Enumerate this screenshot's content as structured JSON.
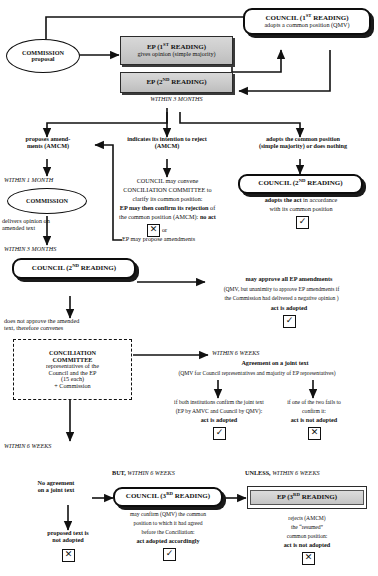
{
  "diagram": {
    "nodes": {
      "commission_proposal": {
        "line1": "COMMISSION",
        "line2": "proposal"
      },
      "ep_first_reading": {
        "line1": "EP (1ST READING)",
        "line2": "gives opinion (simple majority)"
      },
      "council_first_reading": {
        "line1": "COUNCIL  (1ST READING)",
        "line2": "adopts a common position (QMV)"
      },
      "ep_second_reading": {
        "line1": "EP (2ND READING)"
      },
      "commission_opinion": {
        "line1": "COMMISSION"
      },
      "council_second_reading_right": {
        "line1": "COUNCIL (2ND READING)"
      },
      "council_second_reading_left": {
        "line1": "COUNCIL (2ND READING)"
      },
      "conciliation_committee": {
        "line1": "CONCILIATION",
        "line2": "COMMITTEE",
        "line3": "representatives of the",
        "line4": "Council and the EP",
        "line5": "(15 each)",
        "line6": "+ Commission"
      },
      "council_third_reading": {
        "line1": "COUNCIL (3RD READING)"
      },
      "ep_third_reading": {
        "line1": "EP  (3RD READING)"
      }
    },
    "labels": {
      "within_3_months_top": "WITHIN 3 MONTHS",
      "branch_amend": "proposes amend-\nments (AMCM)",
      "branch_reject": "indicates its intention to reject\n(AMCM)",
      "branch_adopt": "adopts the common position\n(simple majority) or does nothing",
      "within_1_month": "WITHIN 1 MONTH",
      "commission_delivers": "delivers opinion on\namended text",
      "within_3_months_second": "WITHIN 3 MONTHS",
      "council_convene_1": "COUNCIL may convene",
      "council_convene_2": "CONCILIATION COMMITTEE to",
      "council_convene_3": "clarify its common position:",
      "council_convene_4_bold": "EP may then confirm its rejection",
      "council_convene_4_tail": " of",
      "council_convene_5_lead": "the common position (AMCM): ",
      "council_convene_5_bold": "no act",
      "or_label": "or",
      "ep_propose_amendments": "EP may propose amendments",
      "council_2nd_adopts_1_bold": "adopts the act",
      "council_2nd_adopts_1_tail": " in accordance",
      "council_2nd_adopts_2": "with its common position",
      "may_approve_bold": "may approve all EP amendments",
      "may_approve_2": "(QMV, but unanimity to approve EP amendments if",
      "may_approve_3": "the Commission had delivered a negative opinion )",
      "act_is_adopted": "act is adopted",
      "does_not_approve": "does not approve the amended\ntext, therefore convenes",
      "within_6_weeks_cc": "WITHIN 6 WEEKS",
      "agreement_joint_text": "Agreement on a joint text",
      "agreement_qmv": "(QMV for Council representatives and majority of EP representatives)",
      "both_confirm_1": "if both institutions confirm the joint text",
      "both_confirm_2": "(EP by AMVC and Council by QMV):",
      "both_confirm_3": "act is adopted",
      "one_fails_1": "if one of the two fails to",
      "one_fails_2": "confirm it:",
      "one_fails_3": "act is not adopted",
      "within_6_weeks_left": "WITHIN 6 WEEKS",
      "no_agreement": "No agreement\non a joint text",
      "proposed_text_not_adopted": "proposed text is\nnot adopted",
      "but_within_6_weeks_bold": "BUT,",
      "but_within_6_weeks_it": " WITHIN 6 WEEKS",
      "unless_within_6_weeks_bold": "UNLESS,",
      "unless_within_6_weeks_it": " WITHIN 6 WEEKS",
      "council_3rd_1": "may confirm (QMV) the common",
      "council_3rd_2": "position to which it had agreed",
      "council_3rd_3": "before the  Conciliation:",
      "council_3rd_4": "act adopted accordingly",
      "ep_3rd_1": "rejects (AMCM)",
      "ep_3rd_2": "the “resumed”",
      "ep_3rd_3": "common position:",
      "ep_3rd_4": "act is not adopted"
    },
    "marks": {
      "reject_no_act": "✕",
      "council_2nd_adopted": "✓",
      "may_approve_adopted": "✓",
      "both_confirm_adopted": "✓",
      "one_fails_not_adopted": "✕",
      "proposed_not_adopted": "✕",
      "council_3rd_adopted": "✓",
      "ep_3rd_not_adopted": "✕"
    },
    "colors": {
      "line": "#111111",
      "box_shaded_fill": "#cfcfcf",
      "paper": "#ffffff"
    }
  }
}
